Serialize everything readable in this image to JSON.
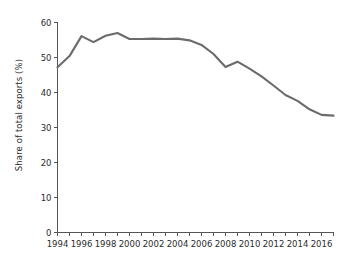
{
  "chart_data": {
    "type": "line",
    "title": "",
    "xlabel": "",
    "ylabel": "Share of total exports (%)",
    "xlim": [
      1994,
      2017
    ],
    "ylim": [
      0,
      60
    ],
    "grid": false,
    "legend": "none",
    "line_color": "#6b6b6b",
    "x": [
      1994,
      1995,
      1996,
      1997,
      1998,
      1999,
      2000,
      2001,
      2002,
      2003,
      2004,
      2005,
      2006,
      2007,
      2008,
      2009,
      2010,
      2011,
      2012,
      2013,
      2014,
      2015,
      2016,
      2017
    ],
    "values": [
      47.2,
      50.4,
      56.1,
      54.4,
      56.2,
      57.0,
      55.3,
      55.3,
      55.4,
      55.3,
      55.4,
      54.9,
      53.6,
      51.0,
      47.3,
      48.8,
      46.8,
      44.6,
      42.0,
      39.3,
      37.6,
      35.2,
      33.6,
      33.4
    ],
    "y_ticks": [
      0,
      10,
      20,
      30,
      40,
      50,
      60
    ],
    "y_tick_labels": [
      "0",
      "10",
      "20",
      "30",
      "40",
      "50",
      "60"
    ],
    "x_ticks": [
      1994,
      1995,
      1996,
      1997,
      1998,
      1999,
      2000,
      2001,
      2002,
      2003,
      2004,
      2005,
      2006,
      2007,
      2008,
      2009,
      2010,
      2011,
      2012,
      2013,
      2014,
      2015,
      2016,
      2017
    ],
    "x_tick_labels": [
      {
        "year": 1994,
        "label": "1994"
      },
      {
        "year": 1996,
        "label": "1996"
      },
      {
        "year": 1998,
        "label": "1998"
      },
      {
        "year": 2000,
        "label": "2000"
      },
      {
        "year": 2002,
        "label": "2002"
      },
      {
        "year": 2004,
        "label": "2004"
      },
      {
        "year": 2006,
        "label": "2006"
      },
      {
        "year": 2008,
        "label": "2008"
      },
      {
        "year": 2010,
        "label": "2010"
      },
      {
        "year": 2012,
        "label": "2012"
      },
      {
        "year": 2014,
        "label": "2014"
      },
      {
        "year": 2016,
        "label": "2016"
      }
    ]
  }
}
